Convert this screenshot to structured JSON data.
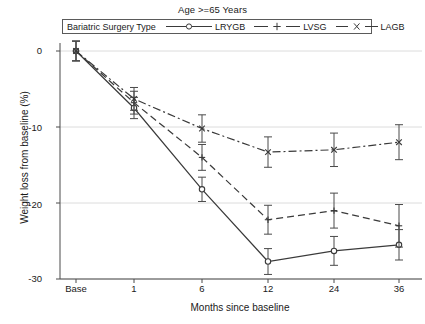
{
  "title": "Age >=65 Years",
  "legend": {
    "title": "Bariatric Surgery Type",
    "entries": [
      {
        "label": "LRYGB",
        "marker": "circle-marker",
        "style": "solid"
      },
      {
        "label": "LVSG",
        "marker": "plus-marker",
        "style": "dashed"
      },
      {
        "label": "LAGB",
        "marker": "cross-marker",
        "style": "dash-dot"
      }
    ]
  },
  "axes": {
    "ylabel": "Weight loss from baseline (%)",
    "xlabel": "Months since baseline",
    "yticks": [
      "0",
      "-10",
      "-20",
      "-30"
    ],
    "xticks": [
      "Base",
      "1",
      "6",
      "12",
      "24",
      "36"
    ]
  },
  "chart_data": {
    "type": "line",
    "title": "Age >=65 Years",
    "xlabel": "Months since baseline",
    "ylabel": "Weight loss from baseline (%)",
    "categories": [
      "Base",
      "1",
      "6",
      "12",
      "24",
      "36"
    ],
    "ylim": [
      -30,
      0
    ],
    "yticks": [
      0,
      -10,
      -20,
      -30
    ],
    "grid": "horizontal",
    "legend_position": "top-inside",
    "legend_title": "Bariatric Surgery Type",
    "series": [
      {
        "name": "LRYGB",
        "line_style": "solid",
        "marker": "circle",
        "color": "#3a3a3a",
        "values": [
          0,
          -7.5,
          -18.2,
          -27.7,
          -26.3,
          -25.5
        ],
        "error_low": [
          -1.3,
          -1.4,
          -1.6,
          -1.7,
          -1.9,
          -2.0
        ],
        "error_high": [
          1.3,
          1.4,
          1.6,
          1.7,
          1.9,
          2.0
        ]
      },
      {
        "name": "LVSG",
        "line_style": "dashed",
        "marker": "plus",
        "color": "#3a3a3a",
        "values": [
          0,
          -6.8,
          -14.0,
          -22.2,
          -21.0,
          -23.0
        ],
        "error_low": [
          -1.3,
          -1.5,
          -1.7,
          -1.9,
          -2.3,
          -2.8
        ],
        "error_high": [
          1.3,
          1.5,
          1.7,
          1.9,
          2.3,
          2.8
        ]
      },
      {
        "name": "LAGB",
        "line_style": "dash-dot",
        "marker": "cross",
        "color": "#3a3a3a",
        "values": [
          0,
          -6.3,
          -10.2,
          -13.3,
          -13.0,
          -12.0
        ],
        "error_low": [
          -1.3,
          -1.5,
          -1.8,
          -2.0,
          -2.2,
          -2.3
        ],
        "error_high": [
          1.3,
          1.5,
          1.8,
          2.0,
          2.2,
          2.3
        ]
      }
    ]
  }
}
